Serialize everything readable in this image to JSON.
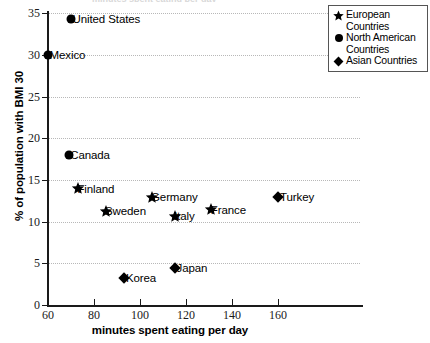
{
  "chart_data": {
    "type": "scatter",
    "title": "",
    "xlabel": "minutes spent eating per day",
    "ylabel": "% of population with BMI 30",
    "xlim": [
      60,
      170
    ],
    "ylim": [
      0,
      35
    ],
    "xticks": [
      60,
      80,
      100,
      120,
      140,
      160
    ],
    "yticks": [
      0,
      5,
      10,
      15,
      20,
      25,
      30,
      35
    ],
    "grid": "horizontal-dotted",
    "legend_position": "top-right",
    "series": [
      {
        "name": "European Countries",
        "marker": "star",
        "points": [
          {
            "label": "Finland",
            "x": 73,
            "y": 14.0
          },
          {
            "label": "Sweden",
            "x": 85,
            "y": 11.3
          },
          {
            "label": "Germany",
            "x": 105,
            "y": 13.0
          },
          {
            "label": "Italy",
            "x": 115,
            "y": 10.7
          },
          {
            "label": "France",
            "x": 131,
            "y": 11.5
          }
        ]
      },
      {
        "name": "North American Countries",
        "marker": "circle",
        "points": [
          {
            "label": "United States",
            "x": 70,
            "y": 34.3
          },
          {
            "label": "Mexico",
            "x": 60,
            "y": 30.0
          },
          {
            "label": "Canada",
            "x": 69,
            "y": 18.0
          }
        ]
      },
      {
        "name": "Asian Countries",
        "marker": "diamond",
        "points": [
          {
            "label": "Korea",
            "x": 93,
            "y": 3.2
          },
          {
            "label": "Japan",
            "x": 115,
            "y": 4.4
          }
        ]
      }
    ]
  },
  "axes": {
    "x_title": "minutes spent eating per day",
    "y_title": "% of population with BMI 30",
    "x_tick_labels": [
      "60",
      "80",
      "100",
      "120",
      "140",
      "160"
    ],
    "y_tick_labels": [
      "0",
      "5",
      "10",
      "15",
      "20",
      "25",
      "30",
      "35"
    ]
  },
  "legend": {
    "items": [
      {
        "marker": "star",
        "label": "European Countries"
      },
      {
        "marker": "circle",
        "label": "North American Countries"
      },
      {
        "marker": "diamond",
        "label": "Asian Countries"
      }
    ]
  },
  "points": [
    {
      "label": "United States",
      "marker": "circle",
      "x": 70,
      "y": 34.3
    },
    {
      "label": "Mexico",
      "marker": "circle",
      "x": 60,
      "y": 30.0
    },
    {
      "label": "Canada",
      "marker": "circle",
      "x": 69,
      "y": 18.0
    },
    {
      "label": "Finland",
      "marker": "star",
      "x": 73,
      "y": 14.0
    },
    {
      "label": "Germany",
      "marker": "star",
      "x": 105,
      "y": 13.0
    },
    {
      "label": "Sweden",
      "marker": "star",
      "x": 85,
      "y": 11.3
    },
    {
      "label": "Italy",
      "marker": "star",
      "x": 115,
      "y": 10.7
    },
    {
      "label": "France",
      "marker": "star",
      "x": 131,
      "y": 11.5
    },
    {
      "label": "Turkey",
      "marker": "diamond",
      "x": 160,
      "y": 13.0
    },
    {
      "label": "Japan",
      "marker": "diamond",
      "x": 115,
      "y": 4.4
    },
    {
      "label": "Korea",
      "marker": "diamond",
      "x": 93,
      "y": 3.2
    }
  ],
  "top_sliver": {
    "text": "minutes spent eating per day"
  },
  "colors": {
    "ink": "#000000",
    "axis": "#1a1a1a",
    "grid": "#b8b8b8",
    "legend_border": "#555555"
  }
}
